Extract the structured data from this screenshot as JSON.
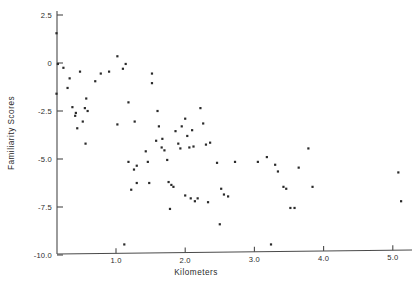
{
  "chart_data": {
    "type": "scatter",
    "title": "",
    "xlabel": "Kilometers",
    "ylabel": "Familiarity  Scores",
    "xlim": [
      0.13,
      5.35
    ],
    "ylim": [
      -10.0,
      3.0
    ],
    "grid": false,
    "legend": null,
    "xticks": [
      1.0,
      2.0,
      3.0,
      4.0,
      5.0
    ],
    "xticklabels": [
      "1.0",
      "2.0",
      "3.0",
      "4.0",
      "5.0"
    ],
    "yticks": [
      2.5,
      0,
      -2.5,
      -5.0,
      -7.5,
      -10.0
    ],
    "yticklabels": [
      "2.5",
      "0",
      "-2.5",
      "-5.0",
      "-7.5",
      "-10.0"
    ],
    "marker": "square-dot",
    "marker_color": "#2a2a2a",
    "points": [
      {
        "x": 0.14,
        "y": 1.55
      },
      {
        "x": 0.16,
        "y": -0.05
      },
      {
        "x": 0.24,
        "y": -0.25
      },
      {
        "x": 0.33,
        "y": -0.8
      },
      {
        "x": 0.14,
        "y": -1.6
      },
      {
        "x": 0.3,
        "y": -1.3
      },
      {
        "x": 0.48,
        "y": -0.45
      },
      {
        "x": 0.37,
        "y": -2.3
      },
      {
        "x": 0.42,
        "y": -2.6
      },
      {
        "x": 0.41,
        "y": -2.75
      },
      {
        "x": 0.55,
        "y": -2.35
      },
      {
        "x": 0.59,
        "y": -2.5
      },
      {
        "x": 0.52,
        "y": -3.05
      },
      {
        "x": 0.57,
        "y": -1.85
      },
      {
        "x": 0.44,
        "y": -3.4
      },
      {
        "x": 0.56,
        "y": -4.2
      },
      {
        "x": 0.7,
        "y": -0.95
      },
      {
        "x": 0.78,
        "y": -0.55
      },
      {
        "x": 0.9,
        "y": -0.45
      },
      {
        "x": 1.02,
        "y": 0.35
      },
      {
        "x": 1.1,
        "y": -0.3
      },
      {
        "x": 1.14,
        "y": -0.05
      },
      {
        "x": 1.18,
        "y": -2.05
      },
      {
        "x": 1.02,
        "y": -3.2
      },
      {
        "x": 1.27,
        "y": -3.05
      },
      {
        "x": 1.18,
        "y": -5.15
      },
      {
        "x": 1.3,
        "y": -5.35
      },
      {
        "x": 1.26,
        "y": -5.55
      },
      {
        "x": 1.3,
        "y": -6.25
      },
      {
        "x": 1.22,
        "y": -6.6
      },
      {
        "x": 1.12,
        "y": -9.45
      },
      {
        "x": 1.43,
        "y": -4.6
      },
      {
        "x": 1.46,
        "y": -5.15
      },
      {
        "x": 1.48,
        "y": -6.25
      },
      {
        "x": 1.52,
        "y": -1.05
      },
      {
        "x": 1.52,
        "y": -0.55
      },
      {
        "x": 1.6,
        "y": -2.5
      },
      {
        "x": 1.62,
        "y": -3.3
      },
      {
        "x": 1.58,
        "y": -4.05
      },
      {
        "x": 1.66,
        "y": -4.4
      },
      {
        "x": 1.67,
        "y": -3.95
      },
      {
        "x": 1.7,
        "y": -4.55
      },
      {
        "x": 1.74,
        "y": -5.05
      },
      {
        "x": 1.76,
        "y": -6.2
      },
      {
        "x": 1.8,
        "y": -6.35
      },
      {
        "x": 1.83,
        "y": -6.45
      },
      {
        "x": 1.78,
        "y": -7.6
      },
      {
        "x": 1.86,
        "y": -3.55
      },
      {
        "x": 1.9,
        "y": -4.2
      },
      {
        "x": 1.93,
        "y": -4.45
      },
      {
        "x": 1.95,
        "y": -3.3
      },
      {
        "x": 2.0,
        "y": -2.9
      },
      {
        "x": 2.03,
        "y": -3.8
      },
      {
        "x": 2.06,
        "y": -4.4
      },
      {
        "x": 2.1,
        "y": -3.5
      },
      {
        "x": 2.12,
        "y": -4.35
      },
      {
        "x": 2.0,
        "y": -6.9
      },
      {
        "x": 2.08,
        "y": -7.05
      },
      {
        "x": 2.14,
        "y": -7.2
      },
      {
        "x": 2.18,
        "y": -7.05
      },
      {
        "x": 2.22,
        "y": -2.35
      },
      {
        "x": 2.26,
        "y": -3.15
      },
      {
        "x": 2.3,
        "y": -4.25
      },
      {
        "x": 2.36,
        "y": -4.15
      },
      {
        "x": 2.33,
        "y": -7.25
      },
      {
        "x": 2.46,
        "y": -5.2
      },
      {
        "x": 2.52,
        "y": -6.55
      },
      {
        "x": 2.56,
        "y": -6.85
      },
      {
        "x": 2.5,
        "y": -8.4
      },
      {
        "x": 2.62,
        "y": -6.95
      },
      {
        "x": 2.72,
        "y": -5.15
      },
      {
        "x": 3.05,
        "y": -5.15
      },
      {
        "x": 3.18,
        "y": -4.9
      },
      {
        "x": 3.24,
        "y": -9.45
      },
      {
        "x": 3.3,
        "y": -5.3
      },
      {
        "x": 3.34,
        "y": -5.65
      },
      {
        "x": 3.42,
        "y": -6.45
      },
      {
        "x": 3.46,
        "y": -6.55
      },
      {
        "x": 3.52,
        "y": -7.55
      },
      {
        "x": 3.58,
        "y": -7.55
      },
      {
        "x": 3.64,
        "y": -5.45
      },
      {
        "x": 3.78,
        "y": -4.45
      },
      {
        "x": 3.84,
        "y": -6.45
      },
      {
        "x": 5.08,
        "y": -5.7
      },
      {
        "x": 5.12,
        "y": -7.2
      }
    ]
  },
  "axes": {
    "x_axis_name": "kilometers-axis",
    "y_axis_name": "familiarity-scores-axis"
  }
}
